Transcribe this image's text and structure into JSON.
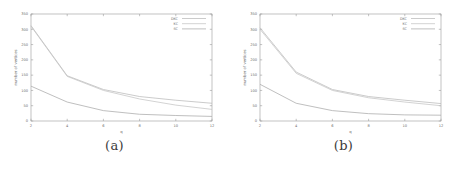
{
  "figure": {
    "panels": [
      {
        "caption": "(a)",
        "chart_data": {
          "type": "line",
          "title": "",
          "xlabel": "q",
          "ylabel": "number of vertices",
          "xlim": [
            2,
            12
          ],
          "ylim": [
            0,
            350
          ],
          "xticks": [
            "2",
            "4",
            "6",
            "8",
            "10",
            "12"
          ],
          "yticks": [
            "0",
            "50",
            "100",
            "150",
            "200",
            "250",
            "300",
            "350"
          ],
          "grid": false,
          "legend_position": "top-right",
          "x": [
            2,
            4,
            6,
            8,
            10,
            12
          ],
          "series": [
            {
              "name": "DKC",
              "values": [
                312,
                148,
                103,
                80,
                68,
                58
              ],
              "color": "#b9b9b9"
            },
            {
              "name": "KC",
              "values": [
                310,
                146,
                100,
                72,
                52,
                38
              ],
              "color": "#c4c4c4"
            },
            {
              "name": "SC",
              "values": [
                114,
                62,
                34,
                22,
                18,
                15
              ],
              "color": "#aaaaaa"
            }
          ]
        }
      },
      {
        "caption": "(b)",
        "chart_data": {
          "type": "line",
          "title": "",
          "xlabel": "q",
          "ylabel": "number of vertices",
          "xlim": [
            2,
            12
          ],
          "ylim": [
            0,
            350
          ],
          "xticks": [
            "2",
            "4",
            "6",
            "8",
            "10",
            "12"
          ],
          "yticks": [
            "0",
            "50",
            "100",
            "150",
            "200",
            "250",
            "300",
            "350"
          ],
          "grid": false,
          "legend_position": "top-right",
          "x": [
            2,
            4,
            6,
            8,
            10,
            12
          ],
          "series": [
            {
              "name": "DKC",
              "values": [
                305,
                160,
                103,
                80,
                68,
                57
              ],
              "color": "#b9b9b9"
            },
            {
              "name": "KC",
              "values": [
                300,
                156,
                100,
                76,
                62,
                50
              ],
              "color": "#c4c4c4"
            },
            {
              "name": "SC",
              "values": [
                120,
                58,
                34,
                24,
                20,
                19
              ],
              "color": "#aaaaaa"
            }
          ]
        }
      }
    ]
  }
}
